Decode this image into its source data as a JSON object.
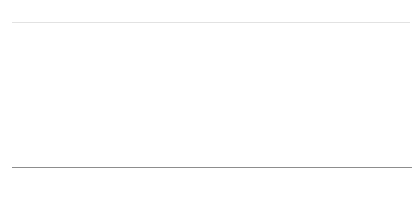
{
  "legend": {
    "position": "top-left",
    "entries": [
      {
        "label": "해외",
        "color": "#8d8d8d",
        "swatch_name": "legend-swatch-overseas"
      },
      {
        "label": "국내",
        "color": "#d9d9d9",
        "swatch_name": "legend-swatch-domestic"
      }
    ]
  },
  "source": {
    "text": "출처: 한국광고총연협회(2017)"
  },
  "chart_data": {
    "type": "bar",
    "stacked": true,
    "stack_total": 100,
    "title": "",
    "subtitle": "",
    "xlabel": "",
    "ylabel": "",
    "ylim": [
      0,
      100
    ],
    "grid": false,
    "legend_position": "top-left",
    "categories": [
      "2005",
      "2006",
      "2007",
      "2008",
      "2009",
      "2010",
      "2011",
      "2012",
      "2013",
      "2014",
      "2015",
      "2016*"
    ],
    "series": [
      {
        "name": "해외",
        "color": "#8d8d8d",
        "values": [
          25,
          26,
          28,
          39,
          46,
          49,
          54,
          60,
          59,
          58,
          58,
          60
        ]
      },
      {
        "name": "국내",
        "color": "#d9d9d9",
        "values": [
          75,
          74,
          72,
          61,
          54,
          51,
          46,
          40,
          41,
          42,
          42,
          40
        ]
      }
    ],
    "annotations": {
      "asterisk_note": "2016*"
    }
  }
}
